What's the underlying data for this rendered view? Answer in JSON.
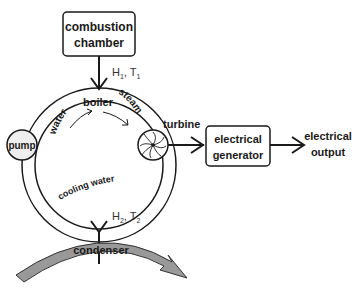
{
  "diagram": {
    "nodes": {
      "combustion_chamber": {
        "line1": "combustion",
        "line2": "chamber"
      },
      "boiler": "boiler",
      "water": "water",
      "steam": "steam",
      "pump": "pump",
      "turbine": "turbine",
      "generator": {
        "line1": "electrical",
        "line2": "generator"
      },
      "output": {
        "line1": "electrical",
        "line2": "output"
      },
      "condenser": "condenser",
      "cooling_water": "cooling water"
    },
    "labels": {
      "heat_in": {
        "h": "H",
        "h_sub": "1",
        "sep": ", T",
        "t_sub": "1"
      },
      "heat_out": {
        "h": "H",
        "h_sub": "2",
        "sep": ", T",
        "t_sub": "2"
      }
    },
    "colors": {
      "stroke": "#1a1a1a",
      "pump_fill": "#eeeeee",
      "condenser_fill": "#999999"
    }
  }
}
